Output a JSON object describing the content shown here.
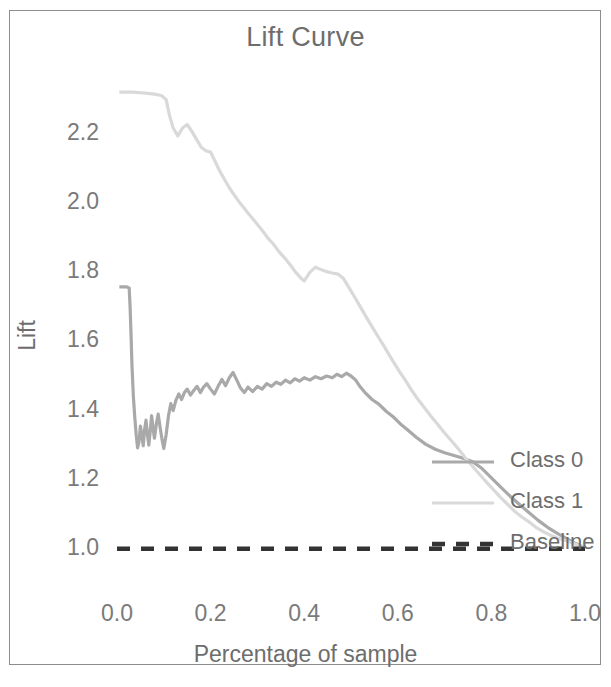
{
  "chart_data": {
    "type": "line",
    "title": "Lift Curve",
    "xlabel": "Percentage of sample",
    "ylabel": "Lift",
    "xlim": [
      0.0,
      1.0
    ],
    "ylim": [
      0.95,
      2.38
    ],
    "grid": false,
    "legend_position": "center-right",
    "xticks": [
      "0.0",
      "0.2",
      "0.4",
      "0.6",
      "0.8",
      "1.0"
    ],
    "xtick_values": [
      0.0,
      0.2,
      0.4,
      0.6,
      0.8,
      1.0
    ],
    "yticks": [
      "1.0",
      "1.2",
      "1.4",
      "1.6",
      "1.8",
      "2.0",
      "2.2"
    ],
    "ytick_values": [
      1.0,
      1.2,
      1.4,
      1.6,
      1.8,
      2.0,
      2.2
    ],
    "series": [
      {
        "name": "Class 0",
        "color": "#a9a9a9",
        "style": "solid",
        "x": [
          0.005,
          0.012,
          0.02,
          0.026,
          0.028,
          0.03,
          0.032,
          0.035,
          0.038,
          0.041,
          0.044,
          0.047,
          0.05,
          0.053,
          0.056,
          0.059,
          0.062,
          0.065,
          0.068,
          0.071,
          0.074,
          0.077,
          0.08,
          0.084,
          0.088,
          0.092,
          0.096,
          0.1,
          0.105,
          0.11,
          0.115,
          0.12,
          0.126,
          0.132,
          0.138,
          0.144,
          0.15,
          0.157,
          0.164,
          0.171,
          0.178,
          0.185,
          0.192,
          0.2,
          0.208,
          0.216,
          0.224,
          0.232,
          0.24,
          0.248,
          0.256,
          0.264,
          0.272,
          0.28,
          0.29,
          0.3,
          0.31,
          0.32,
          0.33,
          0.34,
          0.35,
          0.36,
          0.37,
          0.38,
          0.39,
          0.4,
          0.412,
          0.424,
          0.436,
          0.448,
          0.46,
          0.47,
          0.48,
          0.49,
          0.5,
          0.51,
          0.52,
          0.53,
          0.545,
          0.56,
          0.575,
          0.59,
          0.605,
          0.62,
          0.64,
          0.66,
          0.68,
          0.7,
          0.72,
          0.74,
          0.76,
          0.78,
          0.8,
          0.82,
          0.84,
          0.86,
          0.88,
          0.9,
          0.92,
          0.94,
          0.96,
          0.98,
          1.0
        ],
        "y": [
          1.758,
          1.758,
          1.758,
          1.755,
          1.7,
          1.62,
          1.53,
          1.44,
          1.38,
          1.33,
          1.292,
          1.31,
          1.355,
          1.33,
          1.298,
          1.345,
          1.372,
          1.33,
          1.3,
          1.34,
          1.385,
          1.35,
          1.32,
          1.36,
          1.39,
          1.352,
          1.318,
          1.29,
          1.33,
          1.385,
          1.42,
          1.4,
          1.43,
          1.448,
          1.432,
          1.452,
          1.462,
          1.445,
          1.458,
          1.47,
          1.452,
          1.468,
          1.478,
          1.462,
          1.448,
          1.47,
          1.49,
          1.472,
          1.495,
          1.51,
          1.488,
          1.465,
          1.452,
          1.468,
          1.455,
          1.47,
          1.462,
          1.478,
          1.47,
          1.482,
          1.476,
          1.488,
          1.48,
          1.492,
          1.485,
          1.495,
          1.488,
          1.498,
          1.492,
          1.5,
          1.495,
          1.505,
          1.498,
          1.508,
          1.5,
          1.488,
          1.468,
          1.452,
          1.432,
          1.418,
          1.398,
          1.382,
          1.362,
          1.345,
          1.322,
          1.302,
          1.288,
          1.278,
          1.27,
          1.262,
          1.252,
          1.232,
          1.205,
          1.178,
          1.152,
          1.128,
          1.105,
          1.082,
          1.062,
          1.045,
          1.03,
          1.015,
          1.002
        ]
      },
      {
        "name": "Class 1",
        "color": "#d9d9d9",
        "style": "solid",
        "x": [
          0.005,
          0.02,
          0.035,
          0.05,
          0.065,
          0.08,
          0.095,
          0.105,
          0.112,
          0.12,
          0.13,
          0.14,
          0.15,
          0.16,
          0.17,
          0.18,
          0.19,
          0.2,
          0.21,
          0.22,
          0.23,
          0.24,
          0.25,
          0.262,
          0.274,
          0.286,
          0.298,
          0.31,
          0.322,
          0.334,
          0.346,
          0.358,
          0.37,
          0.382,
          0.394,
          0.4,
          0.412,
          0.424,
          0.436,
          0.448,
          0.46,
          0.472,
          0.484,
          0.496,
          0.508,
          0.52,
          0.532,
          0.544,
          0.556,
          0.568,
          0.58,
          0.592,
          0.604,
          0.616,
          0.628,
          0.64,
          0.655,
          0.67,
          0.685,
          0.7,
          0.715,
          0.73,
          0.745,
          0.76,
          0.775,
          0.79,
          0.805,
          0.82,
          0.835,
          0.85,
          0.865,
          0.88,
          0.895,
          0.91,
          0.925,
          0.94,
          0.955,
          0.97,
          0.985,
          1.0
        ],
        "y": [
          2.322,
          2.322,
          2.322,
          2.32,
          2.318,
          2.316,
          2.312,
          2.3,
          2.255,
          2.218,
          2.195,
          2.218,
          2.228,
          2.208,
          2.185,
          2.162,
          2.152,
          2.148,
          2.12,
          2.092,
          2.068,
          2.045,
          2.025,
          2.002,
          1.982,
          1.962,
          1.942,
          1.922,
          1.9,
          1.882,
          1.86,
          1.842,
          1.822,
          1.8,
          1.782,
          1.775,
          1.8,
          1.815,
          1.808,
          1.802,
          1.798,
          1.795,
          1.782,
          1.755,
          1.728,
          1.7,
          1.672,
          1.645,
          1.618,
          1.592,
          1.565,
          1.538,
          1.512,
          1.488,
          1.462,
          1.438,
          1.412,
          1.385,
          1.36,
          1.335,
          1.312,
          1.288,
          1.262,
          1.238,
          1.215,
          1.192,
          1.17,
          1.148,
          1.128,
          1.108,
          1.092,
          1.078,
          1.062,
          1.05,
          1.04,
          1.032,
          1.025,
          1.018,
          1.01,
          1.002
        ]
      },
      {
        "name": "Baseline",
        "color": "#333333",
        "style": "dashed",
        "x": [
          0.0,
          1.0
        ],
        "y": [
          1.0,
          1.0
        ]
      }
    ]
  },
  "legend": {
    "items": [
      {
        "label": "Class 0",
        "color": "#a9a9a9",
        "style": "solid"
      },
      {
        "label": "Class 1",
        "color": "#d9d9d9",
        "style": "solid"
      },
      {
        "label": "Baseline",
        "color": "#333333",
        "style": "dashed"
      }
    ]
  }
}
